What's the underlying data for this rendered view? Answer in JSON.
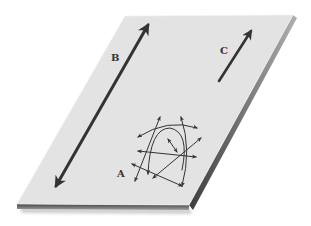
{
  "diagram": {
    "title": "",
    "colors": {
      "surface": "#e3e3e3",
      "surface_edge_top": "#f2f2f2",
      "thickness_dark": "#4a4a4a",
      "thickness_light": "#9a9a9a",
      "arrow": "#333333",
      "label": "#333333",
      "background": "#ffffff"
    },
    "plane": {
      "top_left": [
        125,
        16
      ],
      "top_right": [
        293,
        15
      ],
      "bottom_right": [
        189,
        205
      ],
      "bottom_left": [
        17,
        204
      ],
      "thickness": 5
    },
    "labels": [
      {
        "id": "A",
        "text": "A",
        "x": 117,
        "y": 177
      },
      {
        "id": "B",
        "text": "B",
        "x": 111,
        "y": 61
      },
      {
        "id": "C",
        "text": "C",
        "x": 220,
        "y": 54
      }
    ],
    "arrows": {
      "B": {
        "kind": "double",
        "from": [
          56,
          186
        ],
        "to": [
          148,
          25
        ],
        "width": 3
      },
      "C": {
        "kind": "single",
        "from": [
          219,
          81
        ],
        "to": [
          251,
          31
        ],
        "width": 2.6
      },
      "A_tangle": [
        {
          "d": "M135,181 L160,117",
          "start": true,
          "end": true
        },
        {
          "d": "M181,117 Q192,150 182,186",
          "start": true,
          "end": true
        },
        {
          "d": "M138,137 Q168,118 197,128",
          "start": true,
          "end": true
        },
        {
          "d": "M138,151 L196,157",
          "start": true,
          "end": true
        },
        {
          "d": "M132,164 L182,186",
          "start": true,
          "end": true
        },
        {
          "d": "M148,174 Q150,128 170,128 Q190,132 182,170",
          "start": true,
          "end": false
        },
        {
          "d": "M153,178 L201,138",
          "start": true,
          "end": true
        },
        {
          "d": "M168,139 L177,152",
          "start": true,
          "end": true
        }
      ]
    }
  }
}
